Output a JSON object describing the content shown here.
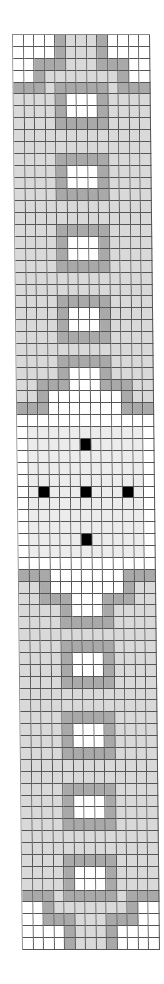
{
  "board": {
    "columns": 13,
    "rows_count": 77,
    "legend": {
      "W": "empty-white",
      "L": "light-gray",
      "D": "dark-gray",
      "F": "faint-gray",
      "X": "black-piece"
    },
    "colors": {
      "W": "#ffffff",
      "L": "#d9d9d9",
      "D": "#a9a9a9",
      "F": "#ececec",
      "X": "#000000"
    },
    "rows": [
      "WWWWDLLLDWWWW",
      "WWWWDLLLDWWWW",
      "WWDDDLLLDDDWW",
      "WWDLLLLLLLDWW",
      "DDDLDDDDDLDDD",
      "LLLLDWWWDLLLL",
      "LLLLDWWWDLLLL",
      "LLLLDDDDDLLLL",
      "LLLLLLLLLLLLL",
      "LLLLLLLLLLLLL",
      "LLLLDDDDDLLLL",
      "LLLLDWWWDLLLL",
      "LLLLDWWWDLLLL",
      "LLLLDDDDDLLLL",
      "LLLLLLLLLLLLL",
      "LLLLLLLLLLLLL",
      "LLLLDDDDDLLLL",
      "LLLLDWWWDLLLL",
      "LLLLDWWWDLLLL",
      "LLLLDDDDDLLLL",
      "LLLLLLLLLLLLL",
      "LLLLLLLLLLLLL",
      "LLLLDDDDDLLLL",
      "LLLLDWWWDLLLL",
      "LLLLDWWWDLLLL",
      "LLLLDDDDDLLLL",
      "LLLLLLLLLLLLL",
      "LLLLDDDDDLLLL",
      "LLLLDWWWDLLLL",
      "LLDDDWWWDDDLL",
      "LLDWWWWWWWDLL",
      "DDDWWWWWWWDDD",
      "WWWWWWWWWWWWW",
      "WFFFFFFFFFFFW",
      "WFFFFFXFFFFFW",
      "WFFFFFFFFFFFW",
      "WFFFFFFFFFFFW",
      "WFFFFFFFFFFFW",
      "WFXFFFXFFFXFW",
      "WFFFFFFFFFFFW",
      "WFFFFFFFFFFFW",
      "WFFFFFFFFFFFW",
      "WFFFFFXFFFFFW",
      "WFFFFFFFFFFFW",
      "WWWWWWWWWWWWW",
      "DDDWWWWWWWDDD",
      "LLDWWWWWWWDLL",
      "LLDDDWWWDDDLL",
      "LLLLDWWWDLLLL",
      "LLLLDDDDDLLLL",
      "LLLLLLLLLLLLL",
      "LLLLDDDDDLLLL",
      "LLLLDWWWDLLLL",
      "LLLLDWWWDLLLL",
      "LLLLDDDDDLLLL",
      "LLLLLLLLLLLLL",
      "LLLLLLLLLLLLL",
      "LLLLDDDDDLLLL",
      "LLLLDWWWDLLLL",
      "LLLLDWWWDLLLL",
      "LLLLDDDDDLLLL",
      "LLLLLLLLLLLLL",
      "LLLLLLLLLLLLL",
      "LLLLDDDDDLLLL",
      "LLLLDWWWDLLLL",
      "LLLLDWWWDLLLL",
      "LLLLDDDDDLLLL",
      "LLLLLLLLLLLLL",
      "LLLLLLLLLLLLL",
      "LLLLDDDDDLLLL",
      "LLLLDWWWDLLLL",
      "LLLLDWWWDLLLL",
      "DDDLDDDDDLDDD",
      "WWDLLLLLLLDWW",
      "WWDDDLLLDDDWW",
      "WWWWDLLLDWWWW",
      "WWWWDLLLDWWWW"
    ],
    "pieces": [
      {
        "row": 34,
        "col": 6,
        "color": "black"
      },
      {
        "row": 38,
        "col": 2,
        "color": "black"
      },
      {
        "row": 38,
        "col": 6,
        "color": "black"
      },
      {
        "row": 38,
        "col": 10,
        "color": "black"
      },
      {
        "row": 42,
        "col": 6,
        "color": "black"
      }
    ]
  }
}
